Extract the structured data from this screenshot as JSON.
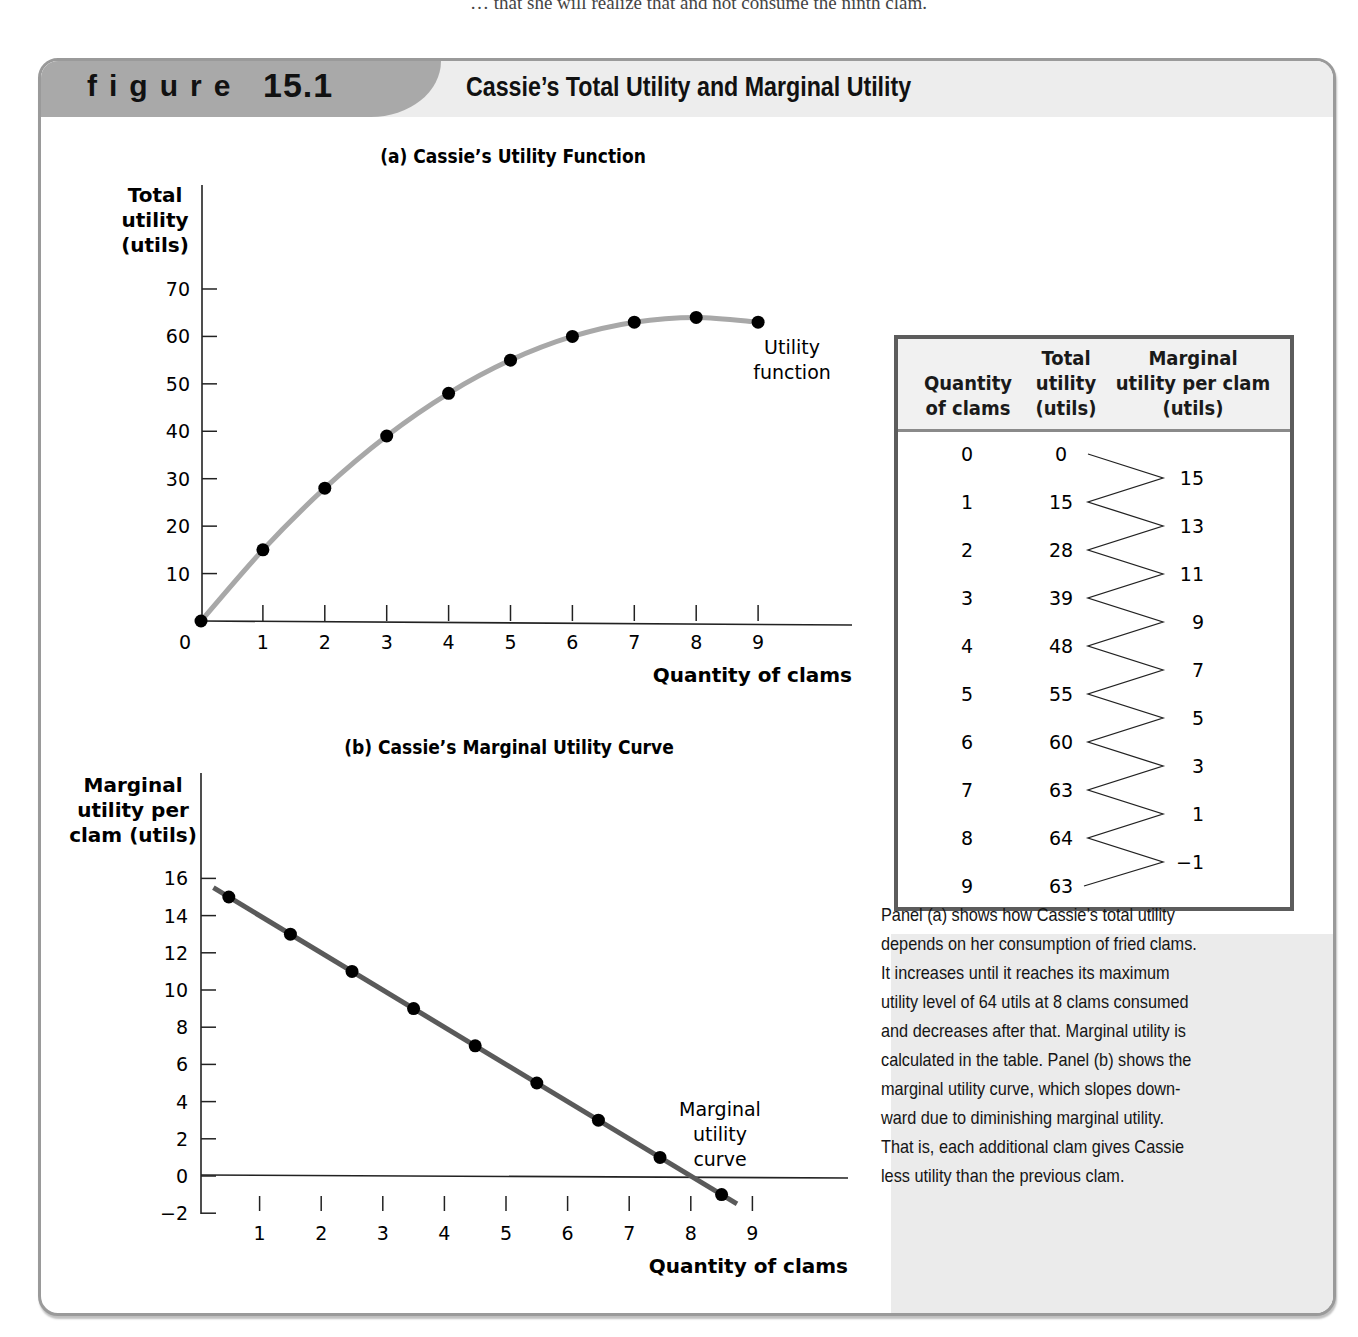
{
  "page_top_text": "… that she will realize that and not consume the ninth clam.",
  "figure": {
    "label": "figure",
    "number": "15.1",
    "title": "Cassie’s Total Utility and Marginal Utility"
  },
  "panel_a": {
    "title": "(a) Cassie’s Utility Function",
    "ylabel_lines": [
      "Total",
      "utility",
      "(utils)"
    ],
    "xlabel": "Quantity of clams",
    "curve_label_lines": [
      "Utility",
      "function"
    ],
    "y_ticks": [
      "70",
      "60",
      "50",
      "40",
      "30",
      "20",
      "10"
    ],
    "x_ticks": [
      "0",
      "1",
      "2",
      "3",
      "4",
      "5",
      "6",
      "7",
      "8",
      "9"
    ]
  },
  "panel_b": {
    "title": "(b) Cassie’s Marginal Utility Curve",
    "ylabel_lines": [
      "Marginal",
      "utility per",
      "clam (utils)"
    ],
    "xlabel": "Quantity of clams",
    "curve_label_lines": [
      "Marginal",
      "utility",
      "curve"
    ],
    "y_ticks": [
      "16",
      "14",
      "12",
      "10",
      "8",
      "6",
      "4",
      "2",
      "0",
      "−2"
    ],
    "x_ticks": [
      "1",
      "2",
      "3",
      "4",
      "5",
      "6",
      "7",
      "8",
      "9"
    ]
  },
  "table": {
    "headers": {
      "quantity": [
        "Quantity",
        "of clams"
      ],
      "total": [
        "Total",
        "utility",
        "(utils)"
      ],
      "marginal": [
        "Marginal",
        "utility per clam",
        "(utils)"
      ]
    },
    "rows": [
      {
        "quantity": "0",
        "total": "0"
      },
      {
        "quantity": "1",
        "total": "15"
      },
      {
        "quantity": "2",
        "total": "28"
      },
      {
        "quantity": "3",
        "total": "39"
      },
      {
        "quantity": "4",
        "total": "48"
      },
      {
        "quantity": "5",
        "total": "55"
      },
      {
        "quantity": "6",
        "total": "60"
      },
      {
        "quantity": "7",
        "total": "63"
      },
      {
        "quantity": "8",
        "total": "64"
      },
      {
        "quantity": "9",
        "total": "63"
      }
    ],
    "marginal": [
      "15",
      "13",
      "11",
      "9",
      "7",
      "5",
      "3",
      "1",
      "−1"
    ]
  },
  "caption": "Panel (a) shows how Cassie’s total utility depends on her consumption of fried clams. It increases until it reaches its maximum utility level of 64 utils at 8 clams consumed and decreases after that. Marginal utility is calculated in the table. Panel (b) shows the marginal utility curve, which slopes downward due to diminishing marginal utility. That is, each additional clam gives Cassie less utility than the previous clam.",
  "caption_lines": [
    "Panel (a) shows how Cassie’s total utility",
    "depends on her consumption of fried clams.",
    "It increases until it reaches its maximum",
    "utility level of 64 utils at 8 clams consumed",
    "and decreases after that. Marginal utility is",
    "calculated in the table. Panel (b) shows the",
    "marginal utility curve, which slopes down-",
    "ward due to diminishing marginal utility.",
    "That is, each additional clam gives Cassie",
    "less utility than the previous clam."
  ],
  "colors": {
    "total_curve": "#a8a8a8",
    "marginal_curve": "#5a5a5a",
    "points": "#000000",
    "tab": "#a9a9a9",
    "header_band": "#ededed",
    "side_panel": "#ebebeb"
  },
  "chart_data": [
    {
      "type": "line",
      "title": "(a) Cassie’s Utility Function",
      "xlabel": "Quantity of clams",
      "ylabel": "Total utility (utils)",
      "x": [
        0,
        1,
        2,
        3,
        4,
        5,
        6,
        7,
        8,
        9
      ],
      "series": [
        {
          "name": "Utility function",
          "values": [
            0,
            15,
            28,
            39,
            48,
            55,
            60,
            63,
            64,
            63
          ]
        }
      ],
      "xlim": [
        0,
        10.5
      ],
      "ylim": [
        0,
        70
      ],
      "y_ticks": [
        10,
        20,
        30,
        40,
        50,
        60,
        70
      ],
      "x_ticks": [
        0,
        1,
        2,
        3,
        4,
        5,
        6,
        7,
        8,
        9
      ],
      "grid": false,
      "annotations": [
        "Utility function"
      ]
    },
    {
      "type": "line",
      "title": "(b) Cassie’s Marginal Utility Curve",
      "xlabel": "Quantity of clams",
      "ylabel": "Marginal utility per clam (utils)",
      "x": [
        0.5,
        1.5,
        2.5,
        3.5,
        4.5,
        5.5,
        6.5,
        7.5,
        8.5
      ],
      "series": [
        {
          "name": "Marginal utility curve",
          "values": [
            15,
            13,
            11,
            9,
            7,
            5,
            3,
            1,
            -1
          ]
        }
      ],
      "xlim": [
        0,
        10.5
      ],
      "ylim": [
        -2,
        16
      ],
      "y_ticks": [
        -2,
        0,
        2,
        4,
        6,
        8,
        10,
        12,
        14,
        16
      ],
      "x_ticks": [
        1,
        2,
        3,
        4,
        5,
        6,
        7,
        8,
        9
      ],
      "grid": false,
      "annotations": [
        "Marginal utility curve"
      ]
    },
    {
      "type": "table",
      "columns": [
        "Quantity of clams",
        "Total utility (utils)",
        "Marginal utility per clam (utils)"
      ],
      "rows": [
        [
          0,
          0,
          null
        ],
        [
          1,
          15,
          15
        ],
        [
          2,
          28,
          13
        ],
        [
          3,
          39,
          11
        ],
        [
          4,
          48,
          9
        ],
        [
          5,
          55,
          7
        ],
        [
          6,
          60,
          5
        ],
        [
          7,
          63,
          3
        ],
        [
          8,
          64,
          1
        ],
        [
          9,
          63,
          -1
        ]
      ]
    }
  ]
}
